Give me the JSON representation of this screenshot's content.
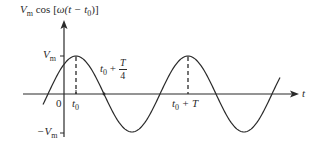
{
  "diagram": {
    "title_expr": {
      "amp": "V",
      "amp_sub": "m",
      "func": "cos",
      "open": "[",
      "omega": "ω",
      "arg": "(t − t",
      "arg_sub": "0",
      "close": ")]"
    },
    "y_labels": {
      "vm": {
        "main": "V",
        "sub": "m"
      },
      "neg_vm": {
        "main": "−V",
        "sub": "m"
      }
    },
    "x_labels": {
      "origin": "0",
      "t0": {
        "main": "t",
        "sub": "0"
      },
      "t0_quarter": {
        "main": "t",
        "sub": "0",
        "plus": " + ",
        "num": "T",
        "den": "4"
      },
      "t0_T": {
        "main": "t",
        "sub": "0",
        "plus": " + T"
      },
      "t_axis": "t"
    },
    "colors": {
      "stroke": "#2a2a2a",
      "background": "#ffffff"
    }
  },
  "chart_data": {
    "type": "line",
    "xlabel": "t",
    "ylabel": "V_m cos[ω(t − t0)]",
    "function": "y = V_m * cos(2π (t − t0) / T)",
    "ytick_labels": [
      "V_m",
      "−V_m"
    ],
    "xtick_labels": [
      "0",
      "t0",
      "t0 + T/4",
      "t0 + T"
    ],
    "annotations": [
      "dashed vertical at t0 (peak)",
      "dashed vertical at t0 + T (peak)",
      "zero crossing at t0 + T/4"
    ],
    "grid": false,
    "periods_shown": 2.1
  }
}
